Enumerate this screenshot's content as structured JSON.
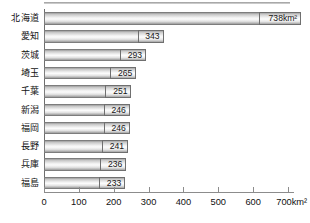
{
  "chart_data": {
    "type": "bar",
    "orientation": "horizontal",
    "title": "",
    "subtitle": "",
    "xlabel": "",
    "ylabel": "",
    "unit": "km²",
    "categories": [
      "北海道",
      "愛知",
      "茨城",
      "埼玉",
      "千葉",
      "新潟",
      "福岡",
      "長野",
      "兵庫",
      "福島"
    ],
    "values": [
      738,
      343,
      293,
      265,
      251,
      246,
      246,
      241,
      236,
      233
    ],
    "value_labels": [
      "738km²",
      "343",
      "293",
      "265",
      "251",
      "246",
      "246",
      "241",
      "236",
      "233"
    ],
    "xlim": [
      0,
      700
    ],
    "xticks": [
      0,
      100,
      200,
      300,
      400,
      500,
      600,
      700
    ],
    "xtick_labels": [
      "0",
      "100",
      "200",
      "300",
      "400",
      "500",
      "600",
      "700km²"
    ],
    "grid": false,
    "legend": false,
    "legend_position": "none",
    "series": [
      {
        "name": "面積",
        "values": [
          738,
          343,
          293,
          265,
          251,
          246,
          246,
          241,
          236,
          233
        ]
      }
    ],
    "bars": [
      {
        "category": "北海道",
        "value": 738,
        "label": "738km²"
      },
      {
        "category": "愛知",
        "value": 343,
        "label": "343"
      },
      {
        "category": "茨城",
        "value": 293,
        "label": "293"
      },
      {
        "category": "埼玉",
        "value": 265,
        "label": "265"
      },
      {
        "category": "千葉",
        "value": 251,
        "label": "251"
      },
      {
        "category": "新潟",
        "value": 246,
        "label": "246"
      },
      {
        "category": "福岡",
        "value": 246,
        "label": "246"
      },
      {
        "category": "長野",
        "value": 241,
        "label": "241"
      },
      {
        "category": "兵庫",
        "value": 236,
        "label": "236"
      },
      {
        "category": "福島",
        "value": 233,
        "label": "233"
      }
    ],
    "colors": {
      "bar_edge": "#7d7d7d",
      "bar_fill_light": "#fbfbfb",
      "bar_fill_dark": "#9a9a9a",
      "axis": "#8c8c8c",
      "text": "#111111",
      "background": "#ffffff"
    }
  }
}
